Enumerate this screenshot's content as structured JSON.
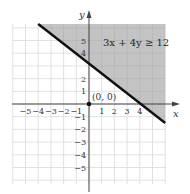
{
  "chart_data": {
    "type": "line",
    "title": "",
    "xlabel": "x",
    "ylabel": "y",
    "xlim": [
      -6,
      6
    ],
    "ylim": [
      -6,
      6
    ],
    "grid": true,
    "x_tick_labels": [
      "−5",
      "−4",
      "−3",
      "−2",
      "−1",
      "1",
      "2",
      "3",
      "4"
    ],
    "y_tick_labels": [
      "5",
      "4",
      "2",
      "1",
      "−1",
      "−2",
      "−3",
      "−4",
      "−5"
    ],
    "series": [
      {
        "name": "3x + 4y = 12",
        "type": "boundary-line",
        "style": "solid",
        "points": [
          [
            -4,
            6
          ],
          [
            6,
            -1.5
          ]
        ]
      }
    ],
    "shaded_region": {
      "inequality": "3x + 4y ≥ 12",
      "side": "above line",
      "color": "#b8b8b8"
    },
    "annotations": [
      {
        "text": "3x + 4y ≥ 12",
        "position": [
          2.5,
          5
        ]
      },
      {
        "text": "(0, 0)",
        "point": [
          0,
          0
        ],
        "marker": "filled-dot"
      }
    ]
  },
  "labels": {
    "x_axis": "x",
    "y_axis": "y",
    "inequality": "3x + 4y ≥ 12",
    "test_point": "(0, 0)"
  }
}
